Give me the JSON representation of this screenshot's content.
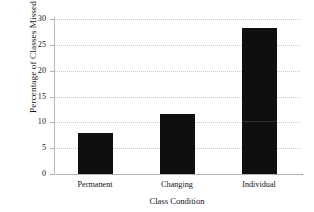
{
  "chart_data": {
    "type": "bar",
    "title": "",
    "subtitle": "",
    "xlabel": "Class Condition",
    "ylabel": "Percentage of Classes Missed",
    "categories": [
      "Permanent",
      "Changing",
      "Individual"
    ],
    "values": [
      8.0,
      11.7,
      28.2
    ],
    "series": [
      {
        "name": "Percentage of Classes Missed",
        "values": [
          8.0,
          11.7,
          28.2
        ]
      }
    ],
    "ylim": [
      0,
      30
    ],
    "yticks": [
      0,
      5,
      10,
      15,
      20,
      25,
      30
    ],
    "ytick_labels": [
      "0",
      "5",
      "10",
      "15",
      "20",
      "25",
      "30"
    ],
    "grid": "horizontal-dotted",
    "legend": "none",
    "bar_color": "#100f0f",
    "grid_color": "#c9c9c9",
    "axis_color": "#9a9a9a",
    "background": "#ffffff",
    "annotations": []
  }
}
